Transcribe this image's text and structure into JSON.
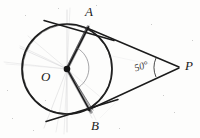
{
  "figure": {
    "background_color": "#fdfdfc",
    "ink_color": "#1a1a1a",
    "pencil_color": "#b9b9bd",
    "width": 200,
    "height": 138
  },
  "labels": {
    "point_a": "A",
    "point_b": "B",
    "center_o": "O",
    "point_p": "P",
    "angle_p": "50°"
  },
  "geometry": {
    "circle": {
      "cx": 67,
      "cy": 69,
      "r": 45
    },
    "points": {
      "O": {
        "x": 67,
        "y": 69
      },
      "A": {
        "x": 88,
        "y": 29
      },
      "B": {
        "x": 88,
        "y": 109
      },
      "P": {
        "x": 178,
        "y": 67
      }
    },
    "segments": [
      {
        "name": "radius-OA",
        "from": "O",
        "to": "A"
      },
      {
        "name": "radius-OB",
        "from": "O",
        "to": "B"
      },
      {
        "name": "tangent-AP",
        "from": "A",
        "to": "P"
      },
      {
        "name": "tangent-BP",
        "from": "B",
        "to": "P"
      }
    ],
    "tangent_line_through_a": {
      "x1": 45,
      "y1": 21,
      "x2": 112,
      "y2": 40
    },
    "tangent_line_through_b": {
      "x1": 47,
      "y1": 121,
      "x2": 116,
      "y2": 100
    },
    "angle_mark": {
      "at": "P",
      "value": "50°",
      "vertex_x": 178,
      "vertex_y": 67
    }
  }
}
